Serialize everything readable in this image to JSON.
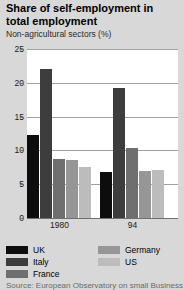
{
  "chart_data": {
    "type": "bar",
    "title": "Share of self-employment in total employment",
    "subtitle": "Non-agricultural sectors (%)",
    "xlabel": "",
    "ylabel": "",
    "ylim": [
      0,
      25
    ],
    "yticks": [
      0,
      5,
      10,
      15,
      20,
      25
    ],
    "ytick_labels": [
      "0",
      "5",
      "10",
      "15",
      "20",
      "25"
    ],
    "grid": true,
    "legend_position": "bottom",
    "categories": [
      "1980",
      "94"
    ],
    "series": [
      {
        "name": "UK",
        "color": "#0d0d0d",
        "values": [
          12.3,
          6.8
        ]
      },
      {
        "name": "Italy",
        "color": "#3d3d3d",
        "values": [
          22.0,
          19.2
        ]
      },
      {
        "name": "France",
        "color": "#6f6f6f",
        "values": [
          8.8,
          10.4
        ]
      },
      {
        "name": "Germany",
        "color": "#969696",
        "values": [
          8.6,
          7.0
        ]
      },
      {
        "name": "US",
        "color": "#bcbcbc",
        "values": [
          7.5,
          7.1
        ]
      }
    ],
    "source": "Source: European Observatory on small Business"
  }
}
